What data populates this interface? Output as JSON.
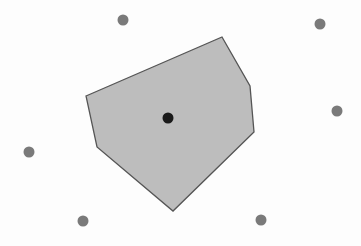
{
  "diagram": {
    "type": "voronoi-cell",
    "width": 361,
    "height": 246,
    "background": "#fdfdfd",
    "cell": {
      "vertices": [
        [
          86,
          96
        ],
        [
          222,
          37
        ],
        [
          250,
          86
        ],
        [
          254,
          132
        ],
        [
          173,
          211
        ],
        [
          97,
          147
        ]
      ],
      "fill": "#bdbdbd",
      "stroke": "#555555",
      "stroke_width": 1.3
    },
    "site": {
      "x": 168,
      "y": 118,
      "r": 5.5,
      "color": "#1a1a1a"
    },
    "neighbors": {
      "color": "#7a7a7a",
      "r": 5.5,
      "points": [
        {
          "x": 123,
          "y": 20
        },
        {
          "x": 320,
          "y": 24
        },
        {
          "x": 337,
          "y": 111
        },
        {
          "x": 29,
          "y": 152
        },
        {
          "x": 83,
          "y": 221
        },
        {
          "x": 261,
          "y": 220
        }
      ]
    }
  }
}
